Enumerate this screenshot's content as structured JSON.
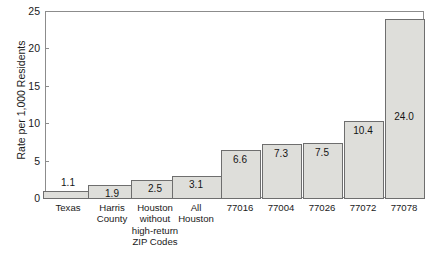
{
  "chart_data": {
    "type": "bar",
    "title": "",
    "xlabel": "",
    "ylabel": "Rate per 1,000 Residents",
    "ylim": [
      0,
      25
    ],
    "yticks": [
      0,
      5,
      10,
      15,
      20,
      25
    ],
    "ytick_labels": [
      "0",
      "5",
      "10",
      "15",
      "20",
      "25"
    ],
    "grid": false,
    "legend": "none",
    "categories": [
      "Texas",
      "Harris\nCounty",
      "Houston\nwithout\nhigh-return\nZIP Codes",
      "All\nHouston",
      "77016",
      "77004",
      "77026",
      "77072",
      "77078"
    ],
    "values": [
      1.1,
      1.9,
      2.5,
      3.1,
      6.6,
      7.3,
      7.5,
      10.4,
      24.0
    ],
    "value_labels": [
      "1.1",
      "1.9",
      "2.5",
      "3.1",
      "6.6",
      "7.3",
      "7.5",
      "10.4",
      "24.0"
    ],
    "bar_color": "#dededa",
    "bar_border_color": "#6e6e6e",
    "axis_color": "#8c8c8c",
    "text_color": "#1a1a1a",
    "background": "#ffffff"
  }
}
